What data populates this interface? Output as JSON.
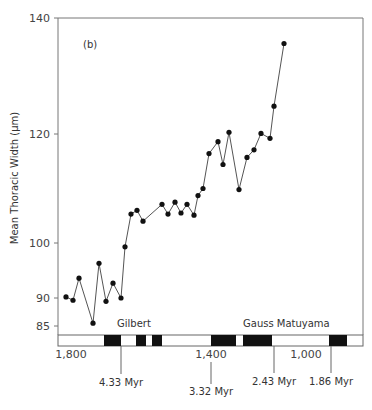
{
  "chart_data": {
    "type": "line",
    "panel_label": "(b)",
    "ylabel": "Mean Thoracic Width (μm)",
    "xlabel": "",
    "y_ticks": [
      85,
      90,
      100,
      120,
      140
    ],
    "y_tick_labels": [
      "85",
      "90",
      "100",
      "120",
      "140"
    ],
    "ylim": [
      85,
      140
    ],
    "x_tick_labels": [
      "1,800",
      "1,400",
      "1,000"
    ],
    "grid": false,
    "legend": null,
    "series": [
      {
        "name": "Mean Thoracic Width",
        "marker": "filled-circle",
        "values": [
          90.2,
          89.6,
          93.6,
          85.5,
          96.3,
          89.4,
          92.7,
          90.0,
          99.3,
          105.3,
          106.0,
          104.0,
          107.1,
          105.3,
          107.5,
          105.5,
          107.1,
          105.1,
          108.7,
          110.0,
          116.4,
          118.6,
          114.4,
          120.3,
          109.8,
          115.7,
          117.1,
          120.1,
          119.2,
          124.8,
          135.6
        ]
      }
    ],
    "annotations": {
      "chrons": [
        "Gilbert",
        "Gauss",
        "Matuyama"
      ],
      "chron_label_text": [
        "Gilbert",
        "Gauss Matuyama"
      ],
      "age_markers": [
        "4.33 Myr",
        "3.32 Myr",
        "2.43 Myr",
        "1.86 Myr"
      ]
    }
  },
  "labels": {
    "panel": "(b)",
    "y_axis_title": "Mean Thoracic Width (μm)",
    "y140": "140",
    "y120": "120",
    "y100": "100",
    "y90": "90",
    "y85": "85",
    "x1800": "1,800",
    "x1400": "1,400",
    "x1000": "1,000",
    "gilbert": "Gilbert",
    "gauss_matuyama": "Gauss Matuyama",
    "m433": "4.33 Myr",
    "m332": "3.32 Myr",
    "m243": "2.43 Myr",
    "m186": "1.86 Myr"
  },
  "colors": {
    "line": "#555555",
    "marker": "#111111",
    "frame": "#777777",
    "polarity_normal": "#111111"
  }
}
